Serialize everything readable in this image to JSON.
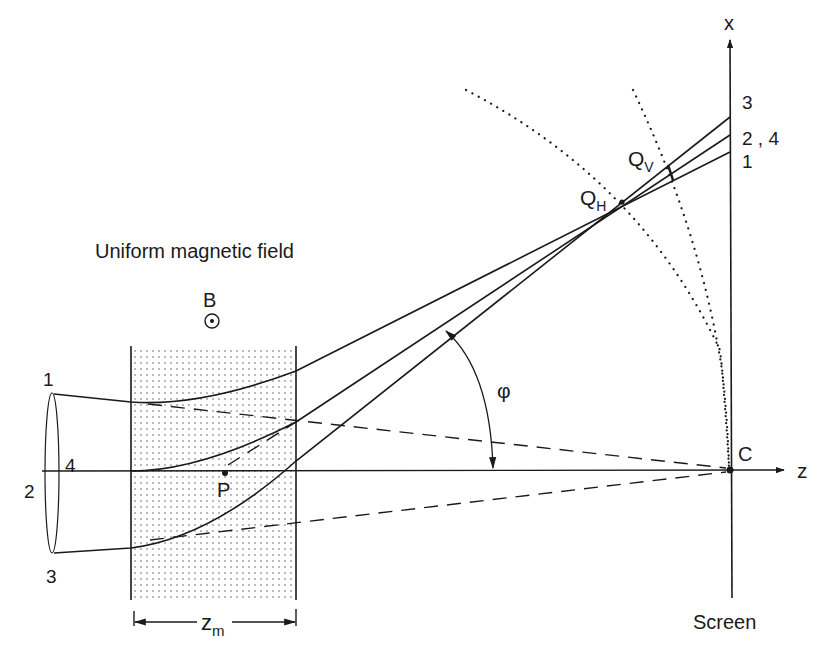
{
  "diagram": {
    "labels": {
      "field_title": "Uniform magnetic field",
      "field_symbol": "B",
      "field_direction": "out-of-page (dot in circle)",
      "x_axis": "x",
      "z_axis": "z",
      "screen": "Screen",
      "origin": "C",
      "point_p": "P",
      "angle": "φ",
      "focus_h": "Q",
      "focus_h_sub": "H",
      "focus_v": "Q",
      "focus_v_sub": "V",
      "region_width": "z",
      "region_width_sub": "m",
      "source_ray_1": "1",
      "source_ray_2": "2",
      "source_ray_3": "3",
      "source_ray_4": "4",
      "screen_ray_3": "3",
      "screen_ray_24": "2 , 4",
      "screen_ray_1": "1"
    },
    "colors": {
      "ink": "#1a1a1a",
      "background": "#ffffff",
      "field_dots": "#555555"
    }
  }
}
